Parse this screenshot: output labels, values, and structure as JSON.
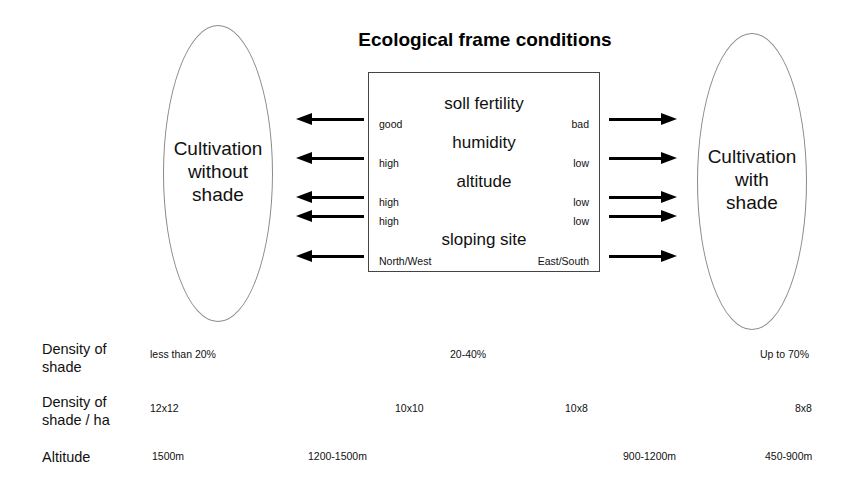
{
  "diagram": {
    "title": "Ecological frame conditions",
    "left_node": {
      "label": "Cultivation\nwithout\nshade",
      "shape": "ellipse"
    },
    "right_node": {
      "label": "Cultivation\nwith\nshade",
      "shape": "ellipse"
    },
    "factors": [
      {
        "name": "soll fertility",
        "left_pole": "good",
        "right_pole": "bad"
      },
      {
        "name": "humidity",
        "left_pole": "high",
        "right_pole": "low"
      },
      {
        "name": "altitude",
        "left_pole": "high",
        "right_pole": "low"
      },
      {
        "name": "",
        "left_pole": "high",
        "right_pole": "low"
      },
      {
        "name": "sloping site",
        "left_pole": "North/West",
        "right_pole": "East/South"
      }
    ],
    "arrows": {
      "left_direction": "left",
      "right_direction": "right",
      "count_each_side": 5
    }
  },
  "table": {
    "rows": [
      {
        "label": "Density of\nshade",
        "values": [
          "less than 20%",
          "20-40%",
          "Up to 70%"
        ]
      },
      {
        "label": "Density of\nshade / ha",
        "values": [
          "12x12",
          "10x10",
          "10x8",
          "8x8"
        ]
      },
      {
        "label": "Altitude",
        "values": [
          "1500m",
          "1200-1500m",
          "900-1200m",
          "450-900m"
        ]
      }
    ]
  },
  "colors": {
    "ink": "#111111",
    "arrow": "#000000",
    "box_border": "#444444",
    "ellipse_border": "#8b8b8b",
    "background": "#ffffff"
  }
}
